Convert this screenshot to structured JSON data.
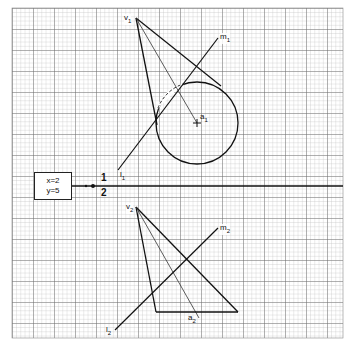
{
  "info_box": {
    "line1": "x=2",
    "line2": "y=5"
  },
  "plane_labels": {
    "upper": "1",
    "lower": "2"
  },
  "points": {
    "v1": {
      "base": "v",
      "sub": "1"
    },
    "m1": {
      "base": "m",
      "sub": "1"
    },
    "a1": {
      "base": "a",
      "sub": "1"
    },
    "l1": {
      "base": "l",
      "sub": "1"
    },
    "v2": {
      "base": "v",
      "sub": "2"
    },
    "m2": {
      "base": "m",
      "sub": "2"
    },
    "a2": {
      "base": "a",
      "sub": "2"
    },
    "l2": {
      "base": "l",
      "sub": "2"
    }
  },
  "colors": {
    "grid_minor": "#b8b8b8",
    "grid_major": "#6a6a6a",
    "ink": "#111111"
  }
}
